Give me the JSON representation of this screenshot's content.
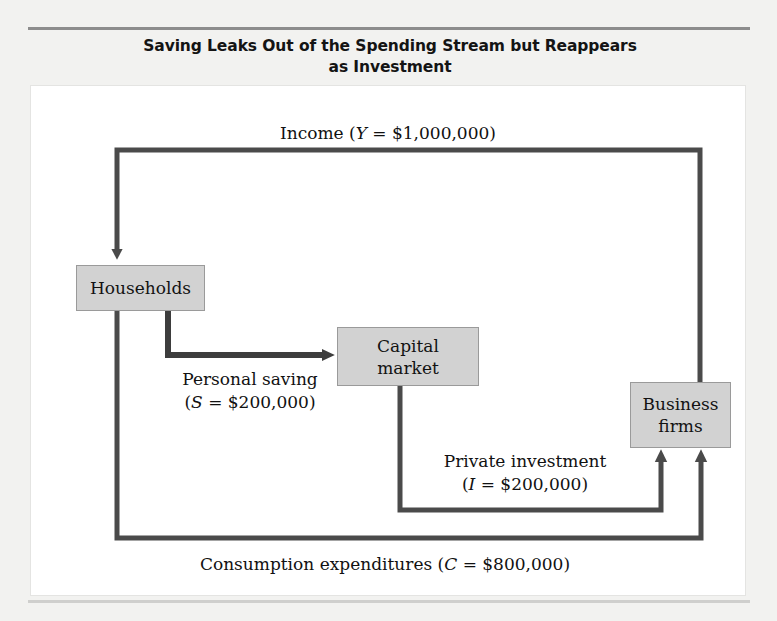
{
  "figure": {
    "title": "Saving Leaks Out of the Spending Stream but Reappears as Investment",
    "title_line1": "Saving Leaks Out of the Spending Stream but Reappears",
    "title_line2": "as Investment"
  },
  "nodes": {
    "households": {
      "label": "Households"
    },
    "capital_market": {
      "label": "Capital\nmarket"
    },
    "business_firms": {
      "label": "Business\nfirms"
    }
  },
  "flows": {
    "income": {
      "name": "Income",
      "symbol": "Y",
      "amount": "$1,000,000",
      "label_text": "Income (",
      "label_tail": " = $1,000,000)",
      "from": "business_firms",
      "to": "households"
    },
    "personal_saving": {
      "name": "Personal saving",
      "symbol": "S",
      "amount": "$200,000",
      "label_line1": "Personal saving",
      "label_open": "(",
      "label_tail": " = $200,000)",
      "from": "households",
      "to": "capital_market"
    },
    "private_investment": {
      "name": "Private investment",
      "symbol": "I",
      "amount": "$200,000",
      "label_line1": "Private investment",
      "label_open": "(",
      "label_tail": " = $200,000)",
      "from": "capital_market",
      "to": "business_firms"
    },
    "consumption": {
      "name": "Consumption expenditures",
      "symbol": "C",
      "amount": "$800,000",
      "label_text": "Consumption expenditures (",
      "label_tail": " = $800,000)",
      "from": "households",
      "to": "business_firms"
    }
  },
  "colors": {
    "arrow": "#4a4a4a",
    "arrow_dark": "#3d3d3d",
    "box_fill": "#d2d2d2",
    "box_border": "#9a9a9a",
    "page_background": "#f2f2f0",
    "panel_background": "#ffffff",
    "text": "#121212"
  }
}
